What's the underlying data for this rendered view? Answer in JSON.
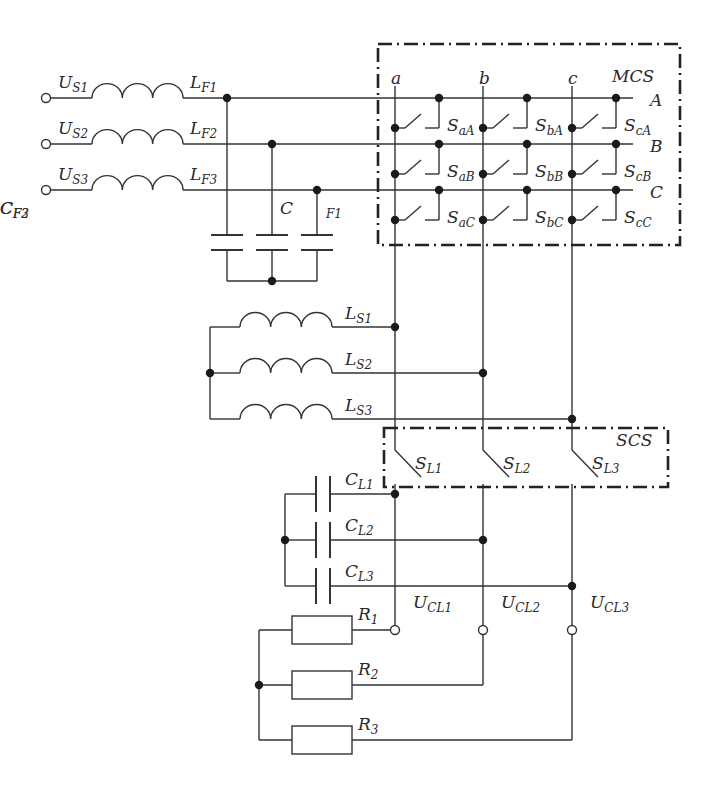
{
  "diagram": {
    "type": "three-phase matrix converter circuit schematic",
    "sources": [
      {
        "label": "U",
        "sub": "S1"
      },
      {
        "label": "U",
        "sub": "S2"
      },
      {
        "label": "U",
        "sub": "S3"
      }
    ],
    "filter_inductors": [
      {
        "label": "L",
        "sub": "F1"
      },
      {
        "label": "L",
        "sub": "F2"
      },
      {
        "label": "L",
        "sub": "F3"
      }
    ],
    "filter_capacitors": [
      {
        "label": "C",
        "sub": "F1"
      },
      {
        "label": "C",
        "sub": "F2"
      },
      {
        "label": "C",
        "sub": "F3"
      }
    ],
    "mcs": {
      "title": "MCS",
      "input_phases": [
        "A",
        "B",
        "C"
      ],
      "output_phases": [
        "a",
        "b",
        "c"
      ],
      "switches": [
        [
          {
            "label": "S",
            "sub": "aA"
          },
          {
            "label": "S",
            "sub": "bA"
          },
          {
            "label": "S",
            "sub": "cA"
          }
        ],
        [
          {
            "label": "S",
            "sub": "aB"
          },
          {
            "label": "S",
            "sub": "bB"
          },
          {
            "label": "S",
            "sub": "cB"
          }
        ],
        [
          {
            "label": "S",
            "sub": "aC"
          },
          {
            "label": "S",
            "sub": "bC"
          },
          {
            "label": "S",
            "sub": "cC"
          }
        ]
      ]
    },
    "load_inductors": [
      {
        "label": "L",
        "sub": "S1"
      },
      {
        "label": "L",
        "sub": "S2"
      },
      {
        "label": "L",
        "sub": "S3"
      }
    ],
    "scs": {
      "title": "SCS",
      "switches": [
        {
          "label": "S",
          "sub": "L1"
        },
        {
          "label": "S",
          "sub": "L2"
        },
        {
          "label": "S",
          "sub": "L3"
        }
      ]
    },
    "load_capacitors": [
      {
        "label": "C",
        "sub": "L1"
      },
      {
        "label": "C",
        "sub": "L2"
      },
      {
        "label": "C",
        "sub": "L3"
      }
    ],
    "output_voltages": [
      {
        "label": "U",
        "sub": "CL1"
      },
      {
        "label": "U",
        "sub": "CL2"
      },
      {
        "label": "U",
        "sub": "CL3"
      }
    ],
    "resistors": [
      {
        "label": "R",
        "sub": "1"
      },
      {
        "label": "R",
        "sub": "2"
      },
      {
        "label": "R",
        "sub": "3"
      }
    ]
  }
}
